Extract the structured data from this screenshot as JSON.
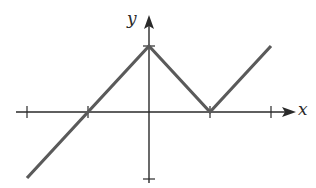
{
  "chart_data": {
    "type": "line",
    "title": "",
    "xlabel": "x",
    "ylabel": "y",
    "x_ticks": [
      -2,
      -1,
      0,
      1,
      2
    ],
    "y_ticks": [
      -1,
      1
    ],
    "xlim": [
      -2.2,
      2.5
    ],
    "ylim": [
      -1.1,
      1.5
    ],
    "grid": false,
    "legend": null,
    "series": [
      {
        "name": "f(x)",
        "points": [
          [
            -2,
            -1
          ],
          [
            -1,
            0
          ],
          [
            0,
            1
          ],
          [
            1,
            0
          ],
          [
            2,
            1
          ]
        ]
      }
    ]
  },
  "labels": {
    "x_axis": "x",
    "y_axis": "y"
  },
  "colors": {
    "axis": "#2a2a2a",
    "curve": "#5a5a5a"
  }
}
